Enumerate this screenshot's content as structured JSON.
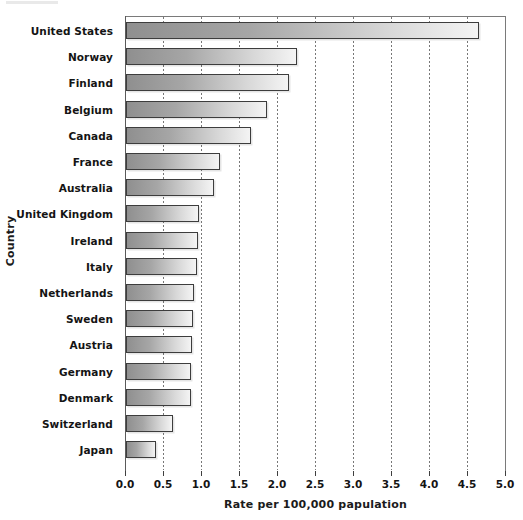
{
  "chart_data": {
    "type": "bar",
    "orientation": "horizontal",
    "title": "",
    "xlabel": "Rate per 100,000 papulation",
    "ylabel": "Country",
    "categories": [
      "United States",
      "Norway",
      "Finland",
      "Belgium",
      "Canada",
      "France",
      "Australia",
      "United Kingdom",
      "Ireland",
      "Italy",
      "Netherlands",
      "Sweden",
      "Austria",
      "Germany",
      "Denmark",
      "Switzerland",
      "Japan"
    ],
    "values": [
      4.65,
      2.25,
      2.15,
      1.85,
      1.64,
      1.24,
      1.16,
      0.96,
      0.95,
      0.93,
      0.9,
      0.88,
      0.87,
      0.86,
      0.85,
      0.62,
      0.4
    ],
    "xlim": [
      0.0,
      5.0
    ],
    "xticks": [
      0.0,
      0.5,
      1.0,
      1.5,
      2.0,
      2.5,
      3.0,
      3.5,
      4.0,
      4.5,
      5.0
    ],
    "xtick_labels": [
      "0.0",
      "0.5",
      "1.0",
      "1.5",
      "2.0",
      "2.5",
      "3.0",
      "3.5",
      "4.0",
      "4.5",
      "5.0"
    ],
    "grid": "vertical-dotted",
    "legend": null,
    "bar_fill": "#a6a6a6",
    "bar_gradient_from": "#8f8f8f",
    "bar_gradient_to": "#f4f4f4",
    "bar_border": "#3d3d3d",
    "gridline_color": "#777777",
    "axis_color": "#5a5a5a",
    "background": "#ffffff"
  }
}
